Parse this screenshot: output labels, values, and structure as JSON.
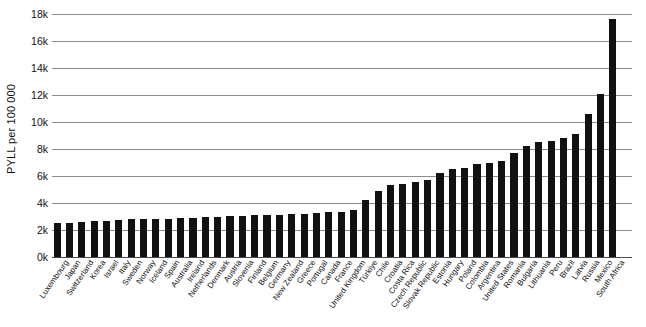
{
  "chart_data": {
    "type": "bar",
    "title": "",
    "subtitle": "",
    "xlabel": "",
    "ylabel": "PYLL per 100 000",
    "ylim": [
      0,
      18000
    ],
    "ytick_labels": [
      "0k",
      "2k",
      "4k",
      "6k",
      "8k",
      "10k",
      "12k",
      "14k",
      "16k",
      "18k"
    ],
    "ytick_values": [
      0,
      2000,
      4000,
      6000,
      8000,
      10000,
      12000,
      14000,
      16000,
      18000
    ],
    "grid": true,
    "legend": "none",
    "bar_color": "#111111",
    "grid_color": "#8c8c8c",
    "categories": [
      "Luxembourg",
      "Japan",
      "Switzerland",
      "Korea",
      "Israel",
      "Italy",
      "Sweden",
      "Norway",
      "Iceland",
      "Spain",
      "Australia",
      "Ireland",
      "Netherlands",
      "Denmark",
      "Austria",
      "Slovenia",
      "Finland",
      "Belgium",
      "Germany",
      "New Zealand",
      "Greece",
      "Portugal",
      "Canada",
      "France",
      "United Kingdom",
      "Türkiye",
      "Chile",
      "Croatia",
      "Costa Rica",
      "Czech Republic",
      "Slovak Republic",
      "Estonia",
      "Hungary",
      "Poland",
      "Colombia",
      "Argentina",
      "United States",
      "Romania",
      "Bulgaria",
      "Lithuania",
      "Peru",
      "Brazil",
      "Latvia",
      "Russia",
      "Mexico",
      "South Africa"
    ],
    "values": [
      2500,
      2550,
      2600,
      2650,
      2700,
      2750,
      2800,
      2800,
      2850,
      2850,
      2900,
      2900,
      2950,
      2950,
      3050,
      3050,
      3100,
      3100,
      3100,
      3150,
      3200,
      3250,
      3300,
      3350,
      3500,
      4200,
      4900,
      5300,
      5400,
      5550,
      5700,
      6200,
      6500,
      6600,
      6900,
      7000,
      7100,
      7700,
      8200,
      8500,
      8600,
      8800,
      9100,
      10600,
      12100,
      17600
    ]
  }
}
